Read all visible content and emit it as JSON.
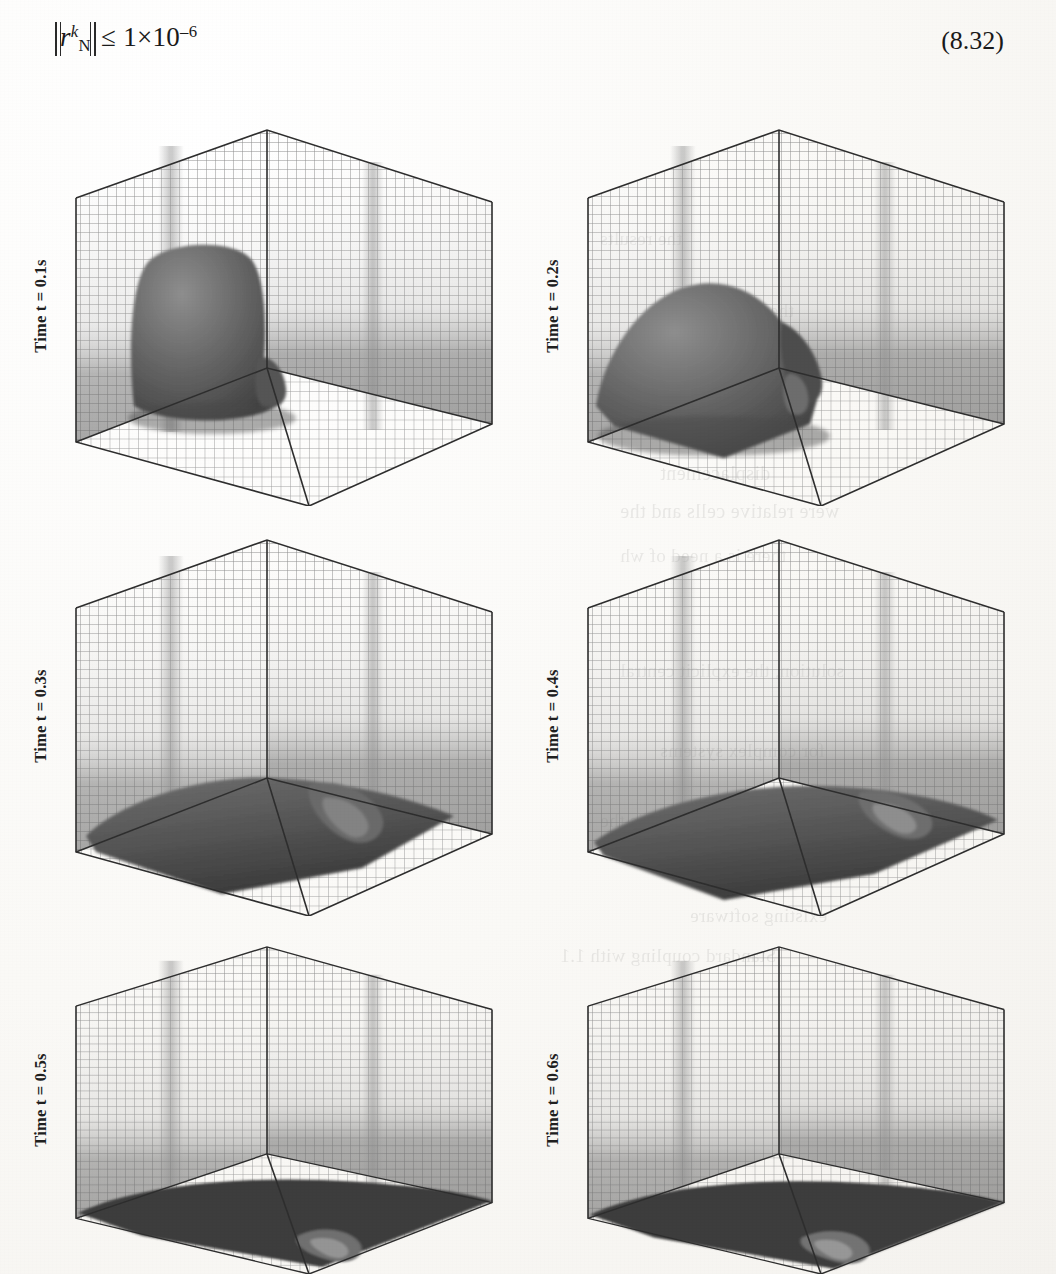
{
  "page": {
    "background_color": "#fbfaf8",
    "ink_color": "#1a1a1a"
  },
  "equation": {
    "name": "residual-convergence-criterion",
    "lhs_symbol": "r",
    "lhs_subscript": "N",
    "lhs_superscript": "k",
    "relation": "≤",
    "rhs": "1×10",
    "rhs_exponent": "–6",
    "full_text": "‖rᴺᵏ‖ ≤ 1×10⁻⁶",
    "number": "(8.32)"
  },
  "figure": {
    "type": "simulation-snapshot-grid",
    "rows": 3,
    "columns": 2,
    "panels": [
      {
        "id": "panel-t01",
        "time_label": "Time t = 0.1s",
        "time_value": 0.1,
        "time_unit": "s",
        "description": "Tall rounded fluid column standing on the floor in the near-left corner of the meshed box",
        "blob_stage": "column"
      },
      {
        "id": "panel-t02",
        "time_label": "Time t = 0.2s",
        "time_value": 0.2,
        "time_unit": "s",
        "description": "Collapsing column slumping forward, surface folding over toward the right",
        "blob_stage": "collapsing"
      },
      {
        "id": "panel-t03",
        "time_label": "Time t = 0.3s",
        "time_value": 0.3,
        "time_unit": "s",
        "description": "Fluid spread across the floor with a breaking tongue rolling to the right",
        "blob_stage": "spreading"
      },
      {
        "id": "panel-t04",
        "time_label": "Time t = 0.4s",
        "time_value": 0.4,
        "time_unit": "s",
        "description": "Thin sheet covering the floor, leading front reaching the far-right wall",
        "blob_stage": "sheet"
      },
      {
        "id": "panel-t05",
        "time_label": "Time t = 0.5s",
        "time_value": 0.5,
        "time_unit": "s",
        "description": "Shallow layer on the floor with a small splash-up near the front edge",
        "blob_stage": "shallow-layer"
      },
      {
        "id": "panel-t06",
        "time_label": "Time t = 0.6s",
        "time_value": 0.6,
        "time_unit": "s",
        "description": "Shallow layer on the floor, residual wave near the front-right edge",
        "blob_stage": "shallow-layer"
      }
    ],
    "box": {
      "name": "meshed-domain-box",
      "style": "wireframe-structured-grid",
      "grid_divisions_horizontal": 26,
      "grid_divisions_vertical": 24,
      "edge_color": "#2e2e2e",
      "mesh_color": "#7d7d7d",
      "fluid_color": "#5a5a5a"
    }
  },
  "bleed_through": {
    "note": "Faint mirrored text showing through from the reverse side of the scanned page",
    "lines": [
      "the results",
      "the solution",
      "and the",
      "displacement",
      "were relative cells and the",
      "there is a need of wh",
      "existing software",
      "Standard coupling with 1.1",
      "solution, the explicit central",
      "for complex systems",
      "velocity that is the"
    ]
  }
}
